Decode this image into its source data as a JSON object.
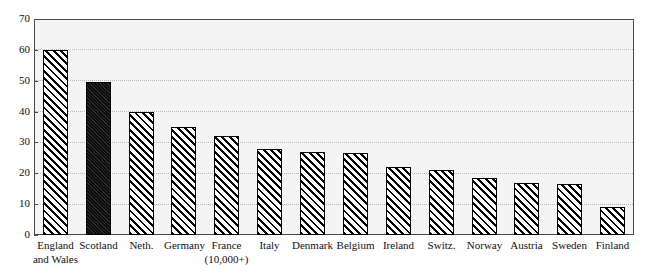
{
  "chart_data": {
    "type": "bar",
    "title": "",
    "subtitle": "",
    "xlabel": "",
    "ylabel": "",
    "ylim": [
      0,
      70
    ],
    "yticks": [
      0,
      10,
      20,
      30,
      40,
      50,
      60,
      70
    ],
    "grid": true,
    "legend": null,
    "orientation": "vertical",
    "categories": [
      "England and Wales",
      "Scotland",
      "Neth.",
      "Germany",
      "France (10,000+)",
      "Italy",
      "Denmark",
      "Belgium",
      "Ireland",
      "Switz.",
      "Norway",
      "Austria",
      "Sweden",
      "Finland"
    ],
    "category_lines": [
      [
        "England",
        "and Wales"
      ],
      [
        "Scotland",
        ""
      ],
      [
        "Neth.",
        ""
      ],
      [
        "Germany",
        ""
      ],
      [
        "France",
        "(10,000+)"
      ],
      [
        "Italy",
        ""
      ],
      [
        "Denmark",
        ""
      ],
      [
        "Belgium",
        ""
      ],
      [
        "Ireland",
        ""
      ],
      [
        "Switz.",
        ""
      ],
      [
        "Norway",
        ""
      ],
      [
        "Austria",
        ""
      ],
      [
        "Sweden",
        ""
      ],
      [
        "Finland",
        ""
      ]
    ],
    "values": [
      60,
      49.5,
      40,
      35,
      32,
      28,
      27,
      26.5,
      22,
      21,
      18.5,
      17,
      16.5,
      9
    ],
    "bar_styles": [
      "hatch",
      "solid",
      "hatch",
      "hatch",
      "hatch",
      "hatch",
      "hatch",
      "hatch",
      "hatch",
      "hatch",
      "hatch",
      "hatch",
      "hatch",
      "hatch"
    ],
    "colors": {
      "hatch_fill": "#ffffff",
      "hatch_line": "#000000",
      "solid_fill": "#141414",
      "bar_border": "#000000",
      "plot_background": "#f4f4f4",
      "frame": "#4a4a4a",
      "gridline": "#b9b9b9",
      "text": "#111111",
      "page_background": "#ffffff"
    }
  }
}
